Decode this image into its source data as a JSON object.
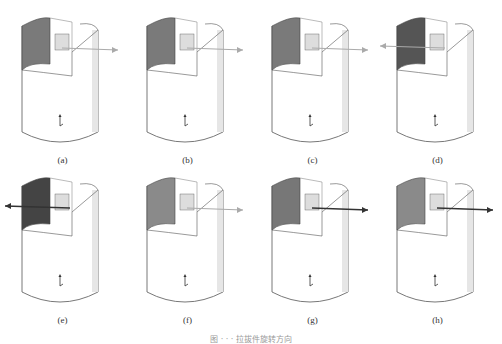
{
  "top_text": "",
  "figure": {
    "caption": "图 · · · 拉拔件旋转方向",
    "panels": [
      {
        "label": "(a)",
        "arrow": "right",
        "shade": "#7a7a7a"
      },
      {
        "label": "(b)",
        "arrow": "right",
        "shade": "#7a7a7a"
      },
      {
        "label": "(c)",
        "arrow": "right",
        "shade": "#7a7a7a"
      },
      {
        "label": "(d)",
        "arrow": "left",
        "shade": "#555555"
      },
      {
        "label": "(e)",
        "arrow": "left-dark",
        "shade": "#444444"
      },
      {
        "label": "(f)",
        "arrow": "right",
        "shade": "#8a8a8a"
      },
      {
        "label": "(g)",
        "arrow": "right-dark",
        "shade": "#777777"
      },
      {
        "label": "(h)",
        "arrow": "right-dark",
        "shade": "#8a8a8a"
      }
    ]
  }
}
